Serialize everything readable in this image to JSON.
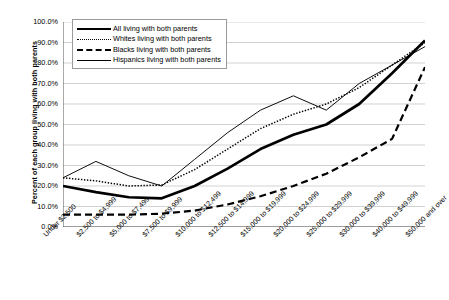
{
  "chart_data": {
    "type": "line",
    "title": "",
    "xlabel": "",
    "ylabel": "Percent of each group living with both parents",
    "ylim": [
      0,
      100
    ],
    "grid": true,
    "legend_position": "top-left",
    "ytick_labels": [
      "100.0%",
      "90.0%",
      "80.0%",
      "70.0%",
      "60.0%",
      "50.0%",
      "40.0%",
      "30.0%",
      "20.0%",
      "10.0%",
      "0.0%"
    ],
    "ytick_values": [
      100,
      90,
      80,
      70,
      60,
      50,
      40,
      30,
      20,
      10,
      0
    ],
    "categories": [
      "Under $2,500",
      "$2,500 to $4,999",
      "$5,000 to $7,499",
      "$7,500 to $9,999",
      "$10,000 to $12,499",
      "$12,500 to $14,999",
      "$15,000 to $19,999",
      "$20,000 to $24,999",
      "$25,000 to $29,999",
      "$30,000 to $39,999",
      "$40,000 to $49,999",
      "$50,000 and over"
    ],
    "series": [
      {
        "name": "All living with both parents",
        "style": "thick-solid",
        "values": [
          20.0,
          17.0,
          14.5,
          14.0,
          20.0,
          28.5,
          38.0,
          45.0,
          50.0,
          60.0,
          75.0,
          91.0
        ]
      },
      {
        "name": "Whites living with both parents",
        "style": "dotted",
        "values": [
          24.0,
          22.5,
          20.0,
          20.5,
          28.0,
          38.0,
          48.0,
          55.0,
          60.0,
          68.0,
          79.0,
          90.0
        ]
      },
      {
        "name": "Blacks living with both parents",
        "style": "dashed",
        "values": [
          6.0,
          6.0,
          6.0,
          6.5,
          8.0,
          11.0,
          15.0,
          20.0,
          26.0,
          34.0,
          43.0,
          78.0
        ]
      },
      {
        "name": "Hispanics living with both parents",
        "style": "thin-solid",
        "values": [
          24.0,
          32.0,
          25.0,
          20.0,
          33.0,
          46.0,
          57.0,
          64.0,
          57.0,
          70.0,
          79.0,
          88.0
        ]
      }
    ]
  },
  "legend": {
    "items": [
      {
        "label": "All living with both parents"
      },
      {
        "label": "Whites living with both parents"
      },
      {
        "label": "Blacks living with both parents"
      },
      {
        "label": "Hispanics living with both parents"
      }
    ]
  }
}
